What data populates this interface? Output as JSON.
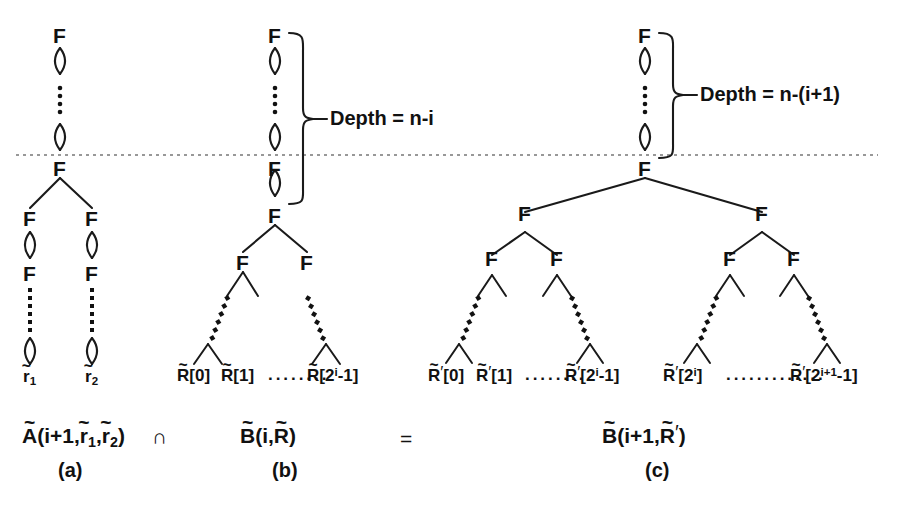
{
  "figure": {
    "caption_symbols": {
      "intersection": "∩",
      "equals": "="
    },
    "dotted_separator_label": "horizontal-dashed-level-line"
  },
  "panels": [
    {
      "id": "a",
      "panel_label": "(a)",
      "formula": "Ã(i+1,r̄1,r̄2)",
      "formula_parts": {
        "name": "A",
        "args": "(i+1,",
        "arg1": "r",
        "arg1_sub": "1",
        "comma": ",",
        "arg2": "r",
        "arg2_sub": "2",
        "close": ")"
      },
      "root_node": "F",
      "nodes": [
        "F",
        "F",
        "F",
        "F",
        "F",
        "F"
      ],
      "leaves": [
        {
          "base": "r",
          "sub": "1",
          "tilde": true
        },
        {
          "base": "r",
          "sub": "2",
          "tilde": true
        }
      ],
      "depth_label": null
    },
    {
      "id": "b",
      "panel_label": "(b)",
      "formula": "B̃(i,R̃)",
      "formula_parts": {
        "name": "B",
        "open": "(i,",
        "arg": "R",
        "close": ")"
      },
      "root_node": "F",
      "nodes": [
        "F",
        "F",
        "F",
        "F"
      ],
      "depth_label": "Depth = n-i",
      "leaves": [
        {
          "base": "R",
          "tilde": true,
          "prime": false,
          "index": "[0]"
        },
        {
          "base": "R",
          "tilde": true,
          "prime": false,
          "index": "[1]"
        },
        {
          "base": "R",
          "tilde": true,
          "prime": false,
          "index": "[2",
          "sup": "i",
          "index_tail": "-1]"
        }
      ],
      "ellipsis": "········"
    },
    {
      "id": "c",
      "panel_label": "(c)",
      "formula": "B̃(i+1,R̃′)",
      "formula_parts": {
        "name": "B",
        "open": "(i+1,",
        "arg": "R",
        "prime": "′",
        "close": ")"
      },
      "root_node": "F",
      "nodes": [
        "F",
        "F",
        "F",
        "F",
        "F",
        "F",
        "F"
      ],
      "depth_label": "Depth = n-(i+1)",
      "leaves": [
        {
          "base": "R",
          "tilde": true,
          "prime": true,
          "index": "[0]"
        },
        {
          "base": "R",
          "tilde": true,
          "prime": true,
          "index": "[1]"
        },
        {
          "base": "R",
          "tilde": true,
          "prime": true,
          "index": "[2",
          "sup": "i",
          "index_tail": "-1]"
        },
        {
          "base": "R",
          "tilde": true,
          "prime": true,
          "index": "[2",
          "sup": "i",
          "index_tail": "]"
        },
        {
          "base": "R",
          "tilde": true,
          "prime": true,
          "index": "[2",
          "sup": "i+1",
          "index_tail": "-1]"
        }
      ],
      "ellipsis_short": "········",
      "ellipsis_long": "·············"
    }
  ],
  "colors": {
    "ink": "#111111",
    "line": "#1a1a1a",
    "dashed": "#666666",
    "background": "#ffffff"
  }
}
